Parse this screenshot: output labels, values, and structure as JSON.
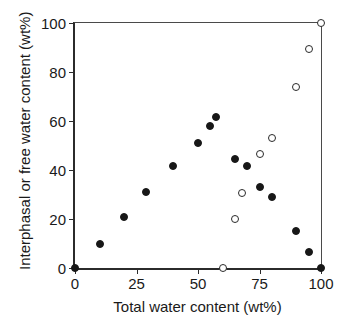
{
  "chart_data": {
    "type": "scatter",
    "title": "",
    "xlabel": "Total water content (wt%)",
    "ylabel": "Interphasal or free water content (wt%)",
    "xlim": [
      0,
      100
    ],
    "ylim": [
      0,
      100
    ],
    "xticks": [
      0,
      25,
      50,
      75,
      100
    ],
    "yticks": [
      0,
      20,
      40,
      60,
      80,
      100
    ],
    "xticklabels": [
      "0",
      "25",
      "50",
      "75",
      "100"
    ],
    "yticklabels": [
      "0",
      "20",
      "40",
      "60",
      "80",
      "100"
    ],
    "grid": false,
    "legend": false,
    "series": [
      {
        "name": "interphasal water",
        "marker": "filled-circle",
        "color": "#171717",
        "points": [
          [
            0,
            0
          ],
          [
            10,
            10
          ],
          [
            20,
            21
          ],
          [
            29,
            31
          ],
          [
            40,
            41.5
          ],
          [
            50,
            51
          ],
          [
            55,
            58
          ],
          [
            57.5,
            61.5
          ],
          [
            65,
            44.5
          ],
          [
            70,
            41.5
          ],
          [
            75,
            33
          ],
          [
            80,
            29
          ],
          [
            90,
            15
          ],
          [
            95,
            6.5
          ],
          [
            100,
            0
          ]
        ]
      },
      {
        "name": "free water",
        "marker": "open-circle",
        "color": "#2a2a2a",
        "points": [
          [
            60,
            0
          ],
          [
            65,
            20
          ],
          [
            68,
            30.5
          ],
          [
            75,
            46.5
          ],
          [
            80,
            53
          ],
          [
            90,
            74
          ],
          [
            95,
            89.5
          ],
          [
            100,
            100
          ]
        ]
      }
    ]
  }
}
